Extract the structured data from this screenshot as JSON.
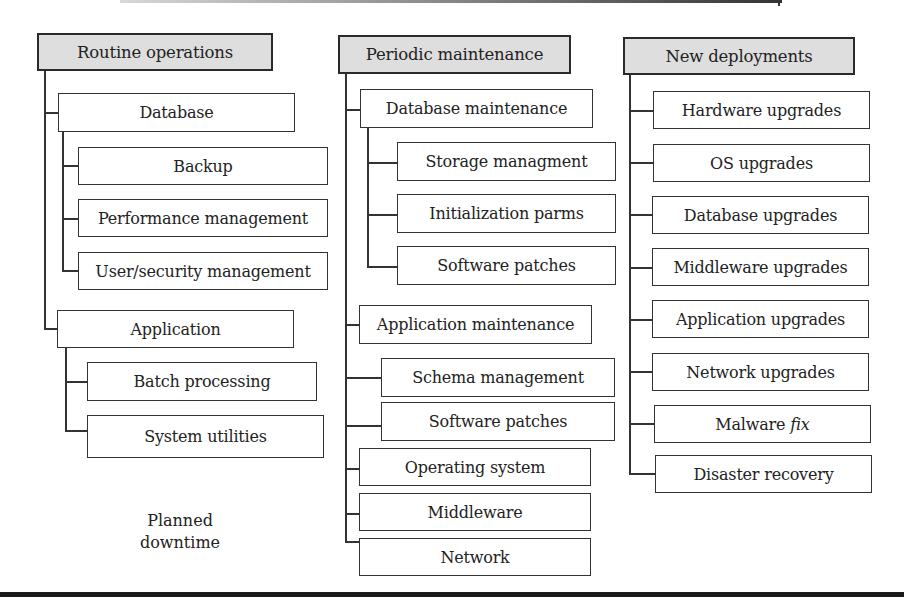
{
  "diagram": {
    "columns": [
      {
        "header": "Routine operations",
        "groups": [
          {
            "label": "Database",
            "children": [
              "Backup",
              "Performance management",
              "User/security management"
            ]
          },
          {
            "label": "Application",
            "children": [
              "Batch processing",
              "System utilities"
            ]
          }
        ]
      },
      {
        "header": "Periodic maintenance",
        "groups": [
          {
            "label": "Database maintenance",
            "children": [
              "Storage managment",
              "Initialization parms",
              "Software patches"
            ]
          },
          {
            "label": "Application maintenance",
            "children": [
              "Schema management",
              "Software patches"
            ]
          }
        ],
        "items": [
          "Operating system",
          "Middleware",
          "Network"
        ]
      },
      {
        "header": "New deployments",
        "items": [
          "Hardware upgrades",
          "OS upgrades",
          "Database upgrades",
          "Middleware upgrades",
          "Application upgrades",
          "Network upgrades",
          {
            "prefix": "Malware ",
            "italic": "fix"
          },
          "Disaster recovery"
        ]
      }
    ],
    "note": {
      "line1": "Planned",
      "line2": "downtime"
    },
    "colors": {
      "header_fill": "#dedede",
      "border": "#333333",
      "background": "#ffffff"
    }
  }
}
